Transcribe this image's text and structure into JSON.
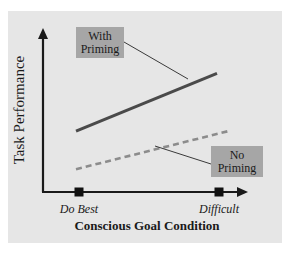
{
  "chart_data": {
    "type": "line",
    "title": "",
    "xlabel": "Conscious Goal Condition",
    "ylabel": "Task Performance",
    "categories": [
      "Do Best",
      "Difficult"
    ],
    "ylim": [
      0,
      10
    ],
    "grid": false,
    "series": [
      {
        "name": "With Priming",
        "label_lines": [
          "With",
          "Priming"
        ],
        "values": [
          4.0,
          7.8
        ],
        "style": "solid",
        "color": "#4a4a4a"
      },
      {
        "name": "No Priming",
        "label_lines": [
          "No",
          "Priming"
        ],
        "values": [
          1.5,
          4.0
        ],
        "style": "dashed",
        "color": "#8c8c8c"
      }
    ],
    "legend": "inline-annotations",
    "colors": {
      "panel_background": "#e6e6e6",
      "label_box": "#a6a6a6",
      "axis": "#1a1a1a",
      "marker": "#111111",
      "text": "#1a1a1a"
    }
  }
}
